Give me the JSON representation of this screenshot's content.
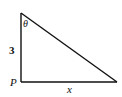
{
  "diagram": {
    "type": "right-triangle",
    "labels": {
      "angle": "θ",
      "vertical_side": "3",
      "vertex": "P",
      "horizontal_side": "x"
    },
    "colors": {
      "stroke": "#111111",
      "background": "#ffffff"
    }
  }
}
